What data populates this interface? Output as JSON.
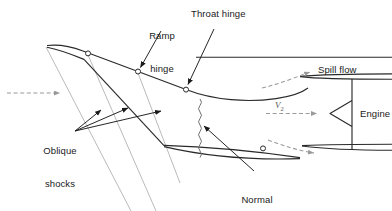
{
  "figure": {
    "type": "technical-diagram",
    "background_color": "#ffffff",
    "line_color": "#1a1a1a",
    "shock_color": "#8c8c8c",
    "flow_arrow_color": "#9a9a9a"
  },
  "labels": {
    "ramp_hinge": "Ramp\nhinge",
    "ramp_hinge_line1": "Ramp",
    "ramp_hinge_line2": "hinge",
    "throat_hinge": "Throat hinge",
    "spill_flow": "Spill flow",
    "engine": "Engine",
    "oblique_shocks_line1": "Oblique",
    "oblique_shocks_line2": "shocks",
    "normal_shock_line1": "Normal",
    "normal_shock_line2": "shock",
    "velocity_symbol": "V",
    "velocity_subscript": "2"
  },
  "geometry": {
    "upper_body": {
      "nose_x": 46,
      "nose_y": 46,
      "ramp_path": "M46,46 C60,45 74,48 86,53 L139,72 L186,90 C230,103 270,100 300,94",
      "aft_line_y": 57,
      "aft_line_x1": 196,
      "aft_line_x2": 392
    },
    "hinges": [
      {
        "name": "forward-ramp-hinge",
        "x": 88,
        "y": 54
      },
      {
        "name": "ramp-hinge",
        "x": 138,
        "y": 72
      },
      {
        "name": "throat-hinge",
        "x": 186,
        "y": 90
      },
      {
        "name": "cowl-flap-hinge",
        "x": 263,
        "y": 148
      }
    ],
    "lower_cowl": {
      "leading_x": 46,
      "leading_y": 48,
      "kink_x": 164,
      "kink_y": 146,
      "lens_tip_x": 300,
      "lens_tip_y": 158
    },
    "shock_lines": [
      {
        "name": "oblique-shock-1",
        "x1": 46,
        "y1": 47,
        "x2": 128,
        "y2": 211
      },
      {
        "name": "oblique-shock-2",
        "x1": 88,
        "y1": 55,
        "x2": 152,
        "y2": 211
      },
      {
        "name": "oblique-shock-3",
        "x1": 138,
        "y1": 73,
        "x2": 178,
        "y2": 180
      }
    ],
    "normal_shock": {
      "x": 200,
      "y_top": 99,
      "y_bottom": 157,
      "amplitude": 2.4,
      "waves": 9
    },
    "flow_arrows": [
      {
        "name": "freestream-arrow",
        "x1": 8,
        "y1": 93,
        "x2": 62,
        "y2": 93
      },
      {
        "name": "spill-flow-arrow-upper",
        "x1": 268,
        "y1": 84,
        "x2": 312,
        "y2": 72
      },
      {
        "name": "spill-flow-arrow-lower",
        "x1": 272,
        "y1": 142,
        "x2": 316,
        "y2": 153
      },
      {
        "name": "engine-inflow-arrow",
        "x1": 266,
        "y1": 113,
        "x2": 318,
        "y2": 113
      }
    ],
    "engine": {
      "cone_tip_x": 330,
      "cone_tip_y": 113,
      "cone_back_x": 352,
      "cone_top_y": 100,
      "cone_bottom_y": 126,
      "pylon_x": 352,
      "pylon_top_y": 88,
      "pylon_bottom_y": 152
    }
  },
  "leader_lines": [
    {
      "name": "ramp-hinge-leader",
      "from_x": 160,
      "from_y": 30,
      "to_x": 139,
      "to_y": 69
    },
    {
      "name": "throat-hinge-leader",
      "from_x": 213,
      "from_y": 27,
      "to_x": 187,
      "to_y": 86
    },
    {
      "name": "oblique-leader-1",
      "from_x": 74,
      "from_y": 131,
      "to_x": 101,
      "to_y": 109
    },
    {
      "name": "oblique-leader-2",
      "from_x": 74,
      "from_y": 131,
      "to_x": 127,
      "to_y": 107
    },
    {
      "name": "oblique-leader-3",
      "from_x": 74,
      "from_y": 131,
      "to_x": 159,
      "to_y": 110
    },
    {
      "name": "normal-shock-leader",
      "from_x": 253,
      "from_y": 170,
      "to_x": 203,
      "to_y": 127
    }
  ]
}
